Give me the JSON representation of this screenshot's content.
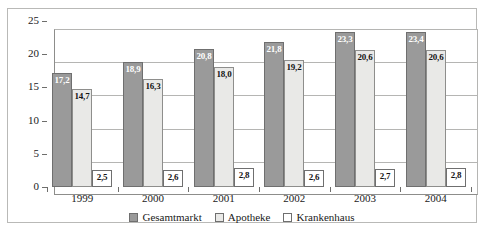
{
  "chart_data": {
    "type": "bar",
    "title": "",
    "subtitle": "",
    "xlabel": "",
    "ylabel": "",
    "categories": [
      "1999",
      "2000",
      "2001",
      "2002",
      "2003",
      "2004"
    ],
    "series": [
      {
        "name": "Gesamtmarkt",
        "color": "#9a9a9a",
        "values": [
          17.2,
          18.9,
          20.8,
          21.8,
          23.3,
          23.4
        ],
        "labels": [
          "17,2",
          "18,9",
          "20,8",
          "21,8",
          "23,3",
          "23,4"
        ]
      },
      {
        "name": "Apotheke",
        "color": "#e9e9e7",
        "values": [
          14.7,
          16.3,
          18.0,
          19.2,
          20.6,
          20.6
        ],
        "labels": [
          "14,7",
          "16,3",
          "18,0",
          "19,2",
          "20,6",
          "20,6"
        ]
      },
      {
        "name": "Krankenhaus",
        "color": "#ffffff",
        "values": [
          2.5,
          2.6,
          2.8,
          2.6,
          2.7,
          2.8
        ],
        "labels": [
          "2,5",
          "2,6",
          "2,8",
          "2,6",
          "2,7",
          "2,8"
        ]
      }
    ],
    "ylim": [
      0,
      25
    ],
    "yticks": [
      0,
      5,
      10,
      15,
      20,
      25
    ],
    "ytick_labels": [
      "0",
      "5",
      "10",
      "15",
      "20",
      "25"
    ],
    "grid": true,
    "legend_position": "bottom"
  }
}
